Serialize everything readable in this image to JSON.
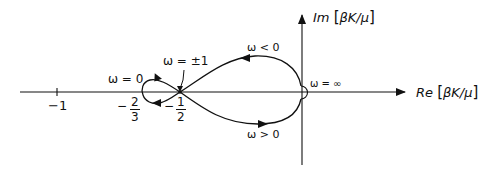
{
  "figure": {
    "type": "nyquist-plot",
    "stroke_color": "#111111",
    "background": "#ffffff"
  },
  "axes": {
    "real_label": "Re",
    "real_unit": "βK/μ",
    "imag_label": "Im",
    "imag_unit": "βK/μ"
  },
  "ticks": {
    "minus_one": "−1",
    "minus_two_thirds": {
      "sign": "−",
      "num": "2",
      "den": "3"
    },
    "minus_one_half": {
      "sign": "−",
      "num": "1",
      "den": "2"
    }
  },
  "annotations": {
    "omega_zero": "ω = 0",
    "omega_pm1": "ω = ±1",
    "omega_neg": "ω < 0",
    "omega_pos": "ω > 0",
    "omega_inf": "ω = ∞"
  },
  "curve": {
    "description": "Nyquist locus: loop from −2/3 crossing at −1/2, large lobe to origin",
    "points": {
      "left_loop_extreme": -0.6667,
      "crossing": -0.5,
      "end": 0
    }
  }
}
